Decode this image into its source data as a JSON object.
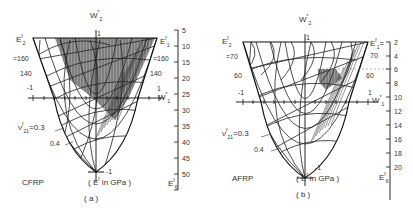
{
  "panels": [
    {
      "id": "a",
      "material": "CFRP",
      "caption": "( a )",
      "unit_note": "( E",
      "unit_note_sup": "f",
      "unit_note_rest": " in GPa )",
      "axis_top": "W",
      "axis_top_sub": "2",
      "axis_top_sup": "*",
      "axis_right": "W",
      "axis_right_sub": "1",
      "axis_right_sup": "*",
      "e2_label": "E",
      "e2_sup": "f",
      "e2_sub": "2",
      "e1_label": "E",
      "e1_sup": "f",
      "e1_sub": "1",
      "e6_label": "E",
      "e6_sup": "f",
      "e6_sub": "6",
      "left_labels": [
        "=160",
        "140",
        "-1"
      ],
      "right_labels": [
        "=160",
        "140",
        "1"
      ],
      "top_one": "1",
      "bottom_minus_one": "-1",
      "nu_label": "ν",
      "nu_sup": "f",
      "nu_sub": "21",
      "nu_val": "=0.3",
      "nu_val2": "0.4",
      "e6_scale": [
        "5",
        "10",
        "15",
        "20",
        "25",
        "30",
        "35",
        "40",
        "45",
        "50"
      ]
    },
    {
      "id": "b",
      "material": "AFRP",
      "caption": "( b )",
      "unit_note": "( E",
      "unit_note_sup": "f",
      "unit_note_rest": " in GPa )",
      "axis_top": "W",
      "axis_top_sub": "2",
      "axis_top_sup": "*",
      "axis_right": "W",
      "axis_right_sub": "1",
      "axis_right_sup": "*",
      "e2_label": "E",
      "e2_sup": "f",
      "e2_sub": "2",
      "e1_label": "E",
      "e1_sup": "f",
      "e1_sub": "1",
      "e6_label": "E",
      "e6_sup": "f",
      "e6_sub": "6",
      "left_labels": [
        "=70",
        "60",
        "-1"
      ],
      "right_labels": [
        "70",
        "60",
        "1"
      ],
      "top_one": "1",
      "bottom_minus_one": "-1",
      "nu_label": "ν",
      "nu_sup": "f",
      "nu_sub": "21",
      "nu_val": "=0.3",
      "nu_val2": "0.4",
      "e6_scale": [
        "2",
        "4",
        "6",
        "8",
        "10",
        "12",
        "14",
        "16",
        "18",
        "20"
      ]
    }
  ]
}
